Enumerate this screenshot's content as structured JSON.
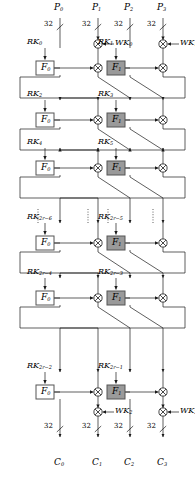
{
  "figure": {
    "type": "generalized-feistel-cipher-block-diagram",
    "branches": 4,
    "branch_bitwidth": "32",
    "bitwidth_label": "32"
  },
  "inputs": [
    {
      "name": "P",
      "index": "0",
      "bits": "32"
    },
    {
      "name": "P",
      "index": "1",
      "bits": "32"
    },
    {
      "name": "P",
      "index": "2",
      "bits": "32"
    },
    {
      "name": "P",
      "index": "3",
      "bits": "32"
    }
  ],
  "outputs": [
    {
      "name": "C",
      "index": "0",
      "bits": "32"
    },
    {
      "name": "C",
      "index": "1",
      "bits": "32"
    },
    {
      "name": "C",
      "index": "2",
      "bits": "32"
    },
    {
      "name": "C",
      "index": "3",
      "bits": "32"
    }
  ],
  "whitening_keys": [
    {
      "name": "WK",
      "index": "0",
      "position": "top-left"
    },
    {
      "name": "WK",
      "index": "1",
      "position": "top-right"
    },
    {
      "name": "WK",
      "index": "2",
      "position": "bottom-left"
    },
    {
      "name": "WK",
      "index": "3",
      "position": "bottom-right"
    }
  ],
  "functions": {
    "left": {
      "name": "F",
      "index": "0",
      "fill": "#ffffff"
    },
    "right": {
      "name": "F",
      "index": "1",
      "fill": "#9a9a9a"
    }
  },
  "rounds": [
    {
      "row": 0,
      "left_key": {
        "name": "RK",
        "index": "0"
      },
      "right_key": {
        "name": "RK",
        "index": "1"
      },
      "ellipsis": false
    },
    {
      "row": 1,
      "left_key": {
        "name": "RK",
        "index": "2"
      },
      "right_key": {
        "name": "RK",
        "index": "3"
      },
      "ellipsis": false
    },
    {
      "row": 2,
      "left_key": {
        "name": "RK",
        "index": "4"
      },
      "right_key": {
        "name": "RK",
        "index": "5"
      },
      "ellipsis": false
    },
    {
      "row": 3,
      "left_key": {
        "name": "RK",
        "index": "2r−6"
      },
      "right_key": {
        "name": "RK",
        "index": "2r−5"
      },
      "ellipsis": true
    },
    {
      "row": 4,
      "left_key": {
        "name": "RK",
        "index": "2r−4"
      },
      "right_key": {
        "name": "RK",
        "index": "2r−3"
      },
      "ellipsis": false
    },
    {
      "row": 5,
      "left_key": {
        "name": "RK",
        "index": "2r−2"
      },
      "right_key": {
        "name": "RK",
        "index": "2r−1"
      },
      "ellipsis": false
    }
  ],
  "colors": {
    "line": "#1a1a1a",
    "f0_fill": "#ffffff",
    "f1_fill": "#9a9a9a",
    "box_stroke": "#555555"
  }
}
